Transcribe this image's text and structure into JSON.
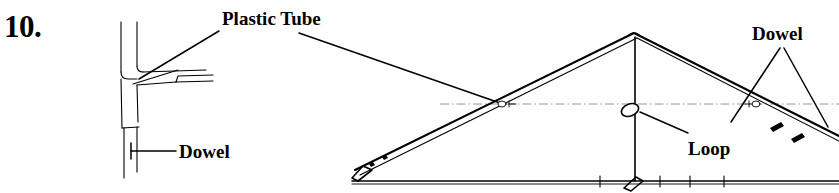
{
  "figure": {
    "item_number": "10.",
    "background_color": "#ffffff",
    "ink_color": "#000000",
    "centerline_color": "#8a8a8a",
    "width": 839,
    "height": 193
  },
  "labels": {
    "plastic_tube": "Plastic Tube",
    "dowel_left": "Dowel",
    "dowel_right": "Dowel",
    "loop": "Loop"
  },
  "detail_view": {
    "name": "plastic-tube-tee-joint-detail",
    "description": "Vertical plastic tube with side branch and dowel inserted at the lower end"
  },
  "elevation_view": {
    "name": "kite-frame-elevation",
    "description": "Triangular kite frame with apex spars, vertical spine, loop and horizontal cross spar"
  }
}
